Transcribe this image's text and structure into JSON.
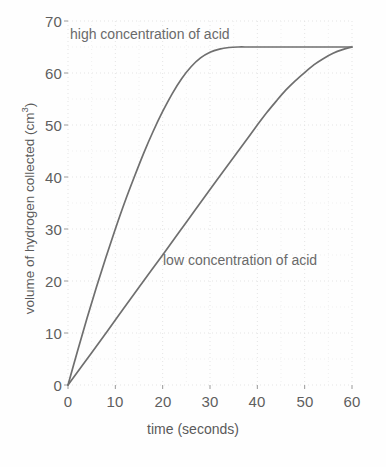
{
  "chart_data": {
    "type": "line",
    "title": "",
    "xlabel": "time (seconds)",
    "ylabel": "volume of hydrogen collected (cm3)",
    "ylabel_base": "volume of hydrogen collected (cm",
    "ylabel_sup": "3",
    "ylabel_tail": ")",
    "xlim": [
      0,
      60
    ],
    "ylim": [
      0,
      70
    ],
    "xticks": [
      0,
      10,
      20,
      30,
      40,
      50,
      60
    ],
    "yticks": [
      0,
      10,
      20,
      30,
      40,
      50,
      60,
      70
    ],
    "xtick_labels": [
      "0",
      "10",
      "20",
      "30",
      "40",
      "50",
      "60"
    ],
    "ytick_labels": [
      "0",
      "10",
      "20",
      "30",
      "40",
      "50",
      "60",
      "70"
    ],
    "grid": "dotted-faint",
    "legend_position": "inline-annotations",
    "plateau_value": 65,
    "line_color": "#6f6f6f",
    "grid_color": "#e4e4e4",
    "text_color": "#5a5a5a",
    "series": [
      {
        "name": "high concentration of acid",
        "annotation": "high concentration of acid",
        "x": [
          0,
          2,
          4,
          6,
          8,
          10,
          12,
          14,
          16,
          18,
          20,
          22,
          24,
          26,
          28,
          30,
          32,
          34,
          36,
          38,
          40,
          45,
          50,
          55,
          60
        ],
        "values": [
          0,
          6.5,
          12.8,
          18.8,
          24.5,
          30.0,
          35.2,
          40.0,
          44.6,
          48.8,
          52.6,
          56.0,
          58.9,
          61.2,
          62.9,
          64.0,
          64.6,
          64.9,
          65.0,
          65.0,
          65.0,
          65.0,
          65.0,
          65.0,
          65.0
        ]
      },
      {
        "name": "low concentration of acid",
        "annotation": "low concentration of acid",
        "x": [
          0,
          5,
          10,
          15,
          20,
          25,
          30,
          35,
          38,
          40,
          42,
          44,
          46,
          48,
          50,
          52,
          54,
          56,
          58,
          60
        ],
        "values": [
          0,
          6.2,
          12.5,
          18.8,
          25.0,
          31.3,
          37.6,
          43.8,
          47.5,
          50.0,
          52.4,
          54.6,
          56.7,
          58.5,
          60.1,
          61.6,
          62.8,
          63.8,
          64.5,
          65.0
        ]
      }
    ]
  },
  "annotations": {
    "high": "high concentration of acid",
    "low": "low concentration of acid"
  }
}
